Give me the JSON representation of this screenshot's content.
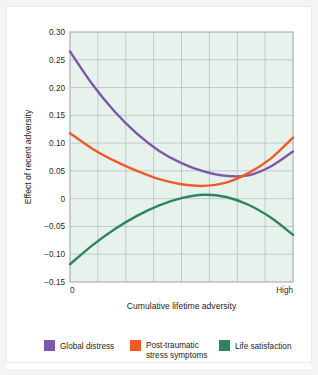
{
  "chart_data": {
    "type": "line",
    "title": "",
    "xlabel": "Cumulative lifetime adversity",
    "ylabel": "Effect of recent adversity",
    "xlim": [
      0,
      1
    ],
    "ylim": [
      -0.15,
      0.3
    ],
    "grid": true,
    "legend_position": "bottom",
    "x_tick_labels": [
      "0",
      "High"
    ],
    "y_tick_labels": [
      "0.30",
      "0.25",
      "0.20",
      "0.15",
      "0.10",
      "0.05",
      "0",
      "-0.05",
      "-0.10",
      "-0.15"
    ],
    "y_tick_values": [
      0.3,
      0.25,
      0.2,
      0.15,
      0.1,
      0.05,
      0,
      -0.05,
      -0.1,
      -0.15
    ],
    "x_gridline_count": 8,
    "x": [
      0,
      0.1,
      0.2,
      0.3,
      0.4,
      0.5,
      0.6,
      0.7,
      0.8,
      0.9,
      1.0
    ],
    "series": [
      {
        "name": "Global distress",
        "color": "#7d58a6",
        "values": [
          0.265,
          0.206,
          0.157,
          0.117,
          0.086,
          0.064,
          0.049,
          0.041,
          0.042,
          0.058,
          0.085
        ]
      },
      {
        "name": "Post-traumatic stress symptoms",
        "color": "#ef5a28",
        "values": [
          0.118,
          0.09,
          0.068,
          0.05,
          0.035,
          0.026,
          0.023,
          0.029,
          0.046,
          0.072,
          0.11
        ]
      },
      {
        "name": "Life satisfaction",
        "color": "#2c8560",
        "values": [
          -0.118,
          -0.084,
          -0.055,
          -0.031,
          -0.012,
          0.001,
          0.007,
          0.003,
          -0.011,
          -0.034,
          -0.065
        ]
      }
    ]
  },
  "legend": {
    "items": [
      {
        "label": "Global distress",
        "color": "#7d58a6"
      },
      {
        "label": "Post-traumatic\nstress symptoms",
        "line1": "Post-traumatic",
        "line2": "stress symptoms",
        "color": "#ef5a28"
      },
      {
        "label": "Life satisfaction",
        "color": "#2c8560"
      }
    ]
  },
  "style": {
    "plot_background": "#e8f2ed",
    "grid_color": "#b6bfc4",
    "plot_border": "#9aa4aa",
    "page_background": "#ffffff"
  }
}
